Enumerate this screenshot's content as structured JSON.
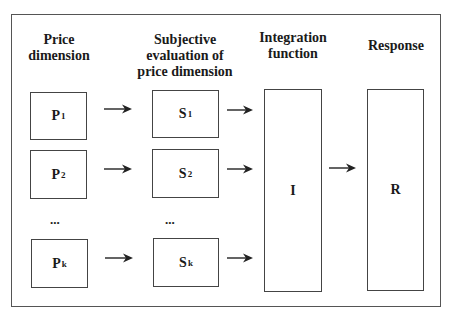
{
  "headers": {
    "price": "Price\ndimension",
    "subjective": "Subjective\nevaluation of\nprice dimension",
    "integration": "Integration\nfunction",
    "response": "Response"
  },
  "price_boxes": [
    {
      "letter": "P",
      "sub": "1"
    },
    {
      "letter": "P",
      "sub": "2"
    },
    {
      "letter": "P",
      "sub": "k"
    }
  ],
  "subjective_boxes": [
    {
      "letter": "S",
      "sub": "1"
    },
    {
      "letter": "S",
      "sub": "2"
    },
    {
      "letter": "S",
      "sub": "k"
    }
  ],
  "ellipsis": "...",
  "integration_box": {
    "label": "I"
  },
  "response_box": {
    "label": "R"
  }
}
